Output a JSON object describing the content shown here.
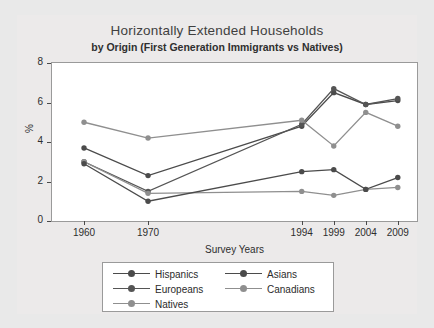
{
  "chart_data": {
    "type": "line",
    "title": "Horizontally Extended Households",
    "subtitle": "by Origin (First Generation Immigrants vs Natives)",
    "xlabel": "Survey Years",
    "ylabel": "%",
    "categories": [
      "1960",
      "1970",
      "1994",
      "1999",
      "2004",
      "2009"
    ],
    "x_positions": [
      1960,
      1970,
      1994,
      1999,
      2004,
      2009
    ],
    "xlim": [
      1955,
      2012
    ],
    "ylim": [
      0,
      8
    ],
    "yticks": [
      0,
      2,
      4,
      6,
      8
    ],
    "grid": false,
    "legend_position": "below",
    "series": [
      {
        "name": "Hispanics",
        "color": "#4b4b4b",
        "values": [
          3.7,
          2.3,
          4.8,
          6.5,
          5.9,
          6.1
        ]
      },
      {
        "name": "Europeans",
        "color": "#555555",
        "values": [
          3.0,
          1.5,
          4.9,
          6.7,
          5.9,
          6.2
        ]
      },
      {
        "name": "Natives",
        "color": "#8f8f8f",
        "values": [
          3.0,
          1.4,
          1.5,
          1.3,
          1.6,
          1.7
        ]
      },
      {
        "name": "Asians",
        "color": "#4b4b4b",
        "values": [
          2.9,
          1.0,
          2.5,
          2.6,
          1.6,
          2.2
        ]
      },
      {
        "name": "Canadians",
        "color": "#8f8f8f",
        "values": [
          5.0,
          4.2,
          5.1,
          3.8,
          5.5,
          4.8
        ]
      }
    ]
  },
  "legend": {
    "column_left": [
      "Hispanics",
      "Europeans",
      "Natives"
    ],
    "column_right": [
      "Asians",
      "Canadians"
    ]
  },
  "axes": {
    "ytick_labels": [
      "8",
      "6",
      "4",
      "2",
      "0"
    ],
    "xtick_labels": [
      "1960",
      "1970",
      "1994",
      "1999",
      "2004",
      "2009"
    ]
  },
  "colors": {
    "dark_line": "#4b4b4b",
    "light_line": "#8f8f8f",
    "panel_bg": "#ffffff",
    "figure_bg": "#eceaea",
    "page_bg": "#e9e9e9"
  }
}
